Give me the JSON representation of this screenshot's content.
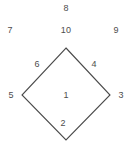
{
  "diagram": {
    "type": "labeled-diamond-region-map",
    "stroke_color": "#4a4a4a",
    "label_color": "#4d4d4d",
    "background_color": "#ffffff",
    "shape": {
      "name": "diamond",
      "vertices": {
        "top": [
          66,
          48
        ],
        "right": [
          110,
          95
        ],
        "bottom": [
          66,
          140
        ],
        "left": [
          22,
          95
        ]
      }
    },
    "labels": [
      {
        "id": "label-8",
        "text": "8",
        "x": 66,
        "y": 8,
        "position": "outside-top-upper"
      },
      {
        "id": "label-7",
        "text": "7",
        "x": 10,
        "y": 30,
        "position": "outside-top-left"
      },
      {
        "id": "label-10",
        "text": "10",
        "x": 66,
        "y": 30,
        "position": "outside-top-center"
      },
      {
        "id": "label-9",
        "text": "9",
        "x": 116,
        "y": 30,
        "position": "outside-top-right"
      },
      {
        "id": "label-6",
        "text": "6",
        "x": 37,
        "y": 64,
        "position": "inside-upper-left-edge"
      },
      {
        "id": "label-4",
        "text": "4",
        "x": 94,
        "y": 64,
        "position": "inside-upper-right-edge"
      },
      {
        "id": "label-5",
        "text": "5",
        "x": 11,
        "y": 95,
        "position": "outside-left-vertex"
      },
      {
        "id": "label-1",
        "text": "1",
        "x": 66,
        "y": 95,
        "position": "inside-center"
      },
      {
        "id": "label-3",
        "text": "3",
        "x": 121,
        "y": 95,
        "position": "outside-right-vertex"
      },
      {
        "id": "label-2",
        "text": "2",
        "x": 63,
        "y": 123,
        "position": "inside-lower-center"
      }
    ]
  }
}
